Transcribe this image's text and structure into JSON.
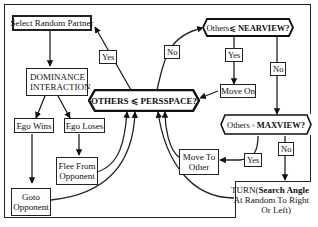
{
  "diagram": {
    "nodes": {
      "select_partner": "Select Random Partner",
      "dominance_line1": "DOMINANCE",
      "dominance_line2": "INTERACTION",
      "ego_wins": "Ego Wins",
      "ego_loses": "Ego Loses",
      "flee_line1": "Flee From",
      "flee_line2": "Opponent",
      "goto_line1": "Goto",
      "goto_line2": "Opponent",
      "perspace_left": "OTHERS",
      "perspace_op": "⩽",
      "perspace_right": "PERSSPACE?",
      "nearview_left": "Others",
      "nearview_op": "⩽",
      "nearview_right": "NEARVIEW?",
      "move_on": "Move On",
      "maxview_left": "Others",
      "maxview_op": "^",
      "maxview_right": "MAXVIEW?",
      "move_to_line1": "Move To",
      "move_to_line2": "Other",
      "turn_prefix": "TURN(",
      "turn_bold": "Search Angle",
      "turn_line2": "At Random To Right",
      "turn_line3": "Or Left)"
    },
    "edge_labels": {
      "perspace_yes": "Yes",
      "perspace_no": "No",
      "nearview_yes": "Yes",
      "nearview_no": "No",
      "maxview_yes": "Yes",
      "maxview_no": "No"
    }
  }
}
